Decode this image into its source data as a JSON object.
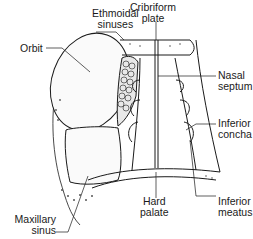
{
  "diagram": {
    "colors": {
      "line": "#1a1a1a",
      "background": "#ffffff",
      "stipple": "#555555"
    },
    "labels": {
      "ethmoidal_sinuses": "Ethmoidal\nsinuses",
      "cribriform_plate": "Cribriform\nplate",
      "orbit": "Orbit",
      "nasal_septum": "Nasal\nseptum",
      "inferior_concha": "Inferior\nconcha",
      "hard_palate": "Hard\npalate",
      "inferior_meatus": "Inferior\nmeatus",
      "maxillary_sinus": "Maxillary\nsinus"
    }
  }
}
